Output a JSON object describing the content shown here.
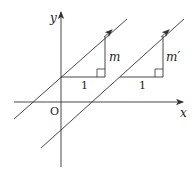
{
  "diagram": {
    "title": "",
    "colors": {
      "stroke": "#333333",
      "text": "#222222",
      "background": "#ffffff"
    },
    "axes": {
      "x_label": "x",
      "y_label": "y",
      "origin_label": "O"
    },
    "lines": [
      {
        "name": "line-1",
        "slope_label": "m",
        "run_label": "1"
      },
      {
        "name": "line-2",
        "slope_label": "m′",
        "run_label": "1"
      }
    ]
  }
}
